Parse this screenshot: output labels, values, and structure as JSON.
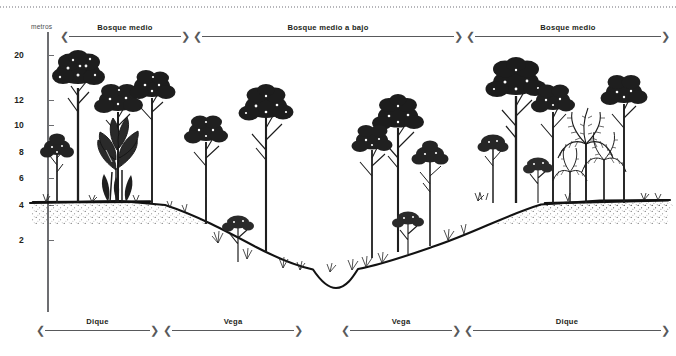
{
  "figure": {
    "type": "ecological-cross-section",
    "unit_label": "metros",
    "axis": {
      "label": "metros",
      "ticks": [
        {
          "value": "20",
          "y": 55
        },
        {
          "value": "12",
          "y": 100
        },
        {
          "value": "10",
          "y": 125
        },
        {
          "value": "8",
          "y": 152
        },
        {
          "value": "6",
          "y": 178
        },
        {
          "value": "4",
          "y": 205
        },
        {
          "value": "2",
          "y": 240
        }
      ]
    },
    "top_bands": [
      {
        "label": "Bosque medio",
        "left": 60,
        "width": 130
      },
      {
        "label": "Bosque medio a bajo",
        "left": 193,
        "width": 270
      },
      {
        "label": "Bosque medio",
        "left": 466,
        "width": 204
      }
    ],
    "bottom_bands": [
      {
        "label": "Dique",
        "left": 36,
        "width": 123
      },
      {
        "label": "Vega",
        "left": 163,
        "width": 140
      },
      {
        "label": "Vega",
        "left": 341,
        "width": 120
      },
      {
        "label": "Dique",
        "left": 464,
        "width": 206
      }
    ],
    "colors": {
      "ink": "#231f20",
      "axis": "#6d6e71",
      "rail": "#58595b",
      "ground": "#1a1a1a",
      "dots": "#a9a9ae"
    },
    "terrain": {
      "left_plateau_y": 202,
      "right_plateau_y": 200,
      "channel_bottom_y": 288,
      "description": "levee-floodplain-channel-floodplain-levee profile"
    },
    "vegetation": {
      "left_levee": "tall canopy trees with broad-leaf understory",
      "left_floodplain": "medium trees and shrubs",
      "right_floodplain": "medium-low trees",
      "right_levee": "canopy trees with palms"
    }
  }
}
